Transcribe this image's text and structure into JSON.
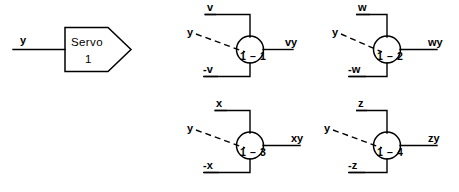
{
  "diagram": {
    "background_color": "#ffffff",
    "line_color": "#000000"
  },
  "servo_block": {
    "name": "Servo",
    "label_line1": "Servo",
    "label_line2": "1",
    "input_label": "y"
  },
  "multipliers": [
    {
      "id": "1-1",
      "label": "1 – 1",
      "top_input": "v",
      "bottom_input": "-v",
      "dashed_input": "y",
      "output": "vy"
    },
    {
      "id": "1-2",
      "label": "1 – 2",
      "top_input": "w",
      "bottom_input": "-w",
      "dashed_input": "y",
      "output": "wy"
    },
    {
      "id": "1-3",
      "label": "1 – 3",
      "top_input": "x",
      "bottom_input": "-x",
      "dashed_input": "y",
      "output": "xy"
    },
    {
      "id": "1-4",
      "label": "1 – 4",
      "top_input": "z",
      "bottom_input": "-z",
      "dashed_input": "y",
      "output": "zy"
    }
  ]
}
